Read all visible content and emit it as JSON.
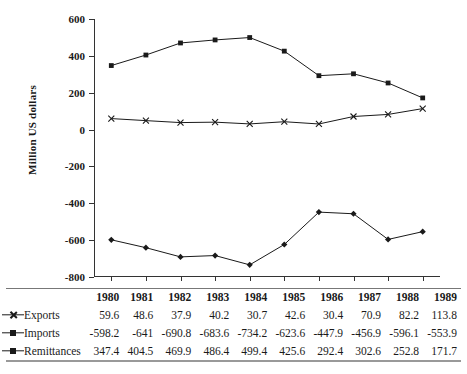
{
  "chart_data": {
    "type": "line",
    "title": "",
    "xlabel": "",
    "ylabel": "Million US dollars",
    "categories": [
      "1980",
      "1981",
      "1982",
      "1983",
      "1984",
      "1985",
      "1986",
      "1987",
      "1988",
      "1989"
    ],
    "ylim": [
      -800,
      600
    ],
    "yticks": [
      600,
      400,
      200,
      0,
      -200,
      -400,
      -600,
      -800
    ],
    "ytick_labels": [
      "600",
      "400",
      "200",
      "0",
      "-200",
      "-400",
      "-600",
      "-800"
    ],
    "grid": false,
    "legend_position": "table-below",
    "series": [
      {
        "name": "Exports",
        "marker": "x",
        "color": "#1a1a1a",
        "values": [
          59.6,
          48.6,
          37.9,
          40.2,
          30.7,
          42.6,
          30.4,
          70.9,
          82.2,
          113.8
        ],
        "labels": [
          "59.6",
          "48.6",
          "37.9",
          "40.2",
          "30.7",
          "42.6",
          "30.4",
          "70.9",
          "82.2",
          "113.8"
        ]
      },
      {
        "name": "Imports",
        "marker": "diamond",
        "color": "#1a1a1a",
        "values": [
          -598.2,
          -641,
          -690.8,
          -683.6,
          -734.2,
          -623.6,
          -447.9,
          -456.9,
          -596.1,
          -553.9
        ],
        "labels": [
          "-598.2",
          "-641",
          "-690.8",
          "-683.6",
          "-734.2",
          "-623.6",
          "-447.9",
          "-456.9",
          "-596.1",
          "-553.9"
        ]
      },
      {
        "name": "Remittances",
        "marker": "square",
        "color": "#1a1a1a",
        "values": [
          347.4,
          404.5,
          469.9,
          486.4,
          499.4,
          425.6,
          292.4,
          302.6,
          252.8,
          171.7
        ],
        "labels": [
          "347.4",
          "404.5",
          "469.9",
          "486.4",
          "499.4",
          "425.6",
          "292.4",
          "302.6",
          "252.8",
          "171.7"
        ]
      }
    ]
  },
  "table": {
    "lead_header": "",
    "headers": [
      "1980",
      "1981",
      "1982",
      "1983",
      "1984",
      "1985",
      "1986",
      "1987",
      "1988",
      "1989"
    ],
    "rows": [
      {
        "label": "Exports",
        "marker": "x",
        "cells": [
          "59.6",
          "48.6",
          "37.9",
          "40.2",
          "30.7",
          "42.6",
          "30.4",
          "70.9",
          "82.2",
          "113.8"
        ]
      },
      {
        "label": "Imports",
        "marker": "square",
        "cells": [
          "-598.2",
          "-641",
          "-690.8",
          "-683.6",
          "-734.2",
          "-623.6",
          "-447.9",
          "-456.9",
          "-596.1",
          "-553.9"
        ]
      },
      {
        "label": "Remittances",
        "marker": "square",
        "cells": [
          "347.4",
          "404.5",
          "469.9",
          "486.4",
          "499.4",
          "425.6",
          "292.4",
          "302.6",
          "252.8",
          "171.7"
        ]
      }
    ]
  }
}
